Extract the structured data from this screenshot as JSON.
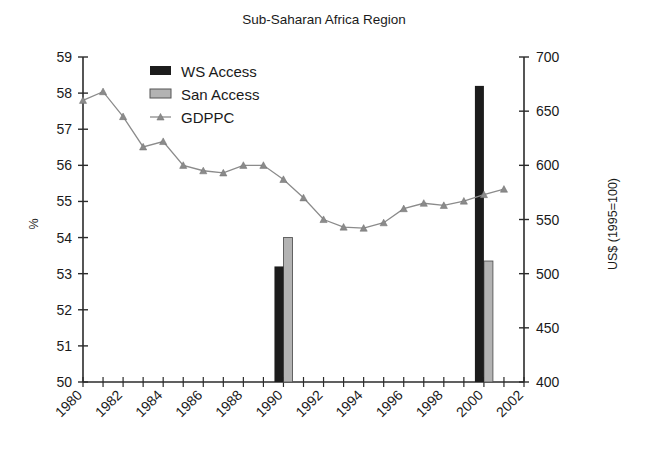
{
  "chart_data": {
    "type": "bar",
    "title": "Sub-Saharan Africa Region",
    "xlabel": "",
    "ylabel": "%",
    "ylabel_secondary": "US$ (1995=100)",
    "ylim": [
      50,
      59
    ],
    "ylim_secondary": [
      400,
      700
    ],
    "xlim": [
      1980,
      2002
    ],
    "grid": false,
    "legend_position": "top-left-inside",
    "x_tick_labels": [
      "1980",
      "1982",
      "1984",
      "1986",
      "1988",
      "1990",
      "1992",
      "1994",
      "1996",
      "1998",
      "2000",
      "2002"
    ],
    "x_tick_values": [
      1980,
      1982,
      1984,
      1986,
      1988,
      1990,
      1992,
      1994,
      1996,
      1998,
      2000,
      2002
    ],
    "y_tick_labels": [
      "50",
      "51",
      "52",
      "53",
      "54",
      "55",
      "56",
      "57",
      "58",
      "59"
    ],
    "y_tick_values": [
      50,
      51,
      52,
      53,
      54,
      55,
      56,
      57,
      58,
      59
    ],
    "y2_tick_labels": [
      "400",
      "450",
      "500",
      "550",
      "600",
      "650",
      "700"
    ],
    "y2_tick_values": [
      400,
      450,
      500,
      550,
      600,
      650,
      700
    ],
    "series": [
      {
        "name": "WS Access",
        "type": "bar",
        "axis": "left",
        "color": "#1c1c1c",
        "x": [
          1990,
          2000
        ],
        "values": [
          53.2,
          58.2
        ]
      },
      {
        "name": "San Access",
        "type": "bar",
        "axis": "left",
        "color": "#b3b3b3",
        "x": [
          1990,
          2000
        ],
        "values": [
          54.0,
          53.35
        ]
      },
      {
        "name": "GDPPC",
        "type": "line",
        "axis": "right",
        "color": "#8b8b8b",
        "x": [
          1980,
          1981,
          1982,
          1983,
          1984,
          1985,
          1986,
          1987,
          1988,
          1989,
          1990,
          1991,
          1992,
          1993,
          1994,
          1995,
          1996,
          1997,
          1998,
          1999,
          2000,
          2001
        ],
        "values_left_scale": [
          57.8,
          58.05,
          57.35,
          56.5,
          56.65,
          56.0,
          55.85,
          55.8,
          56.0,
          56.0,
          55.6,
          55.1,
          54.5,
          54.3,
          54.25,
          54.4,
          54.8,
          54.95,
          54.9,
          55.0,
          55.2,
          55.35
        ],
        "values": [
          660,
          668,
          645,
          617,
          622,
          600,
          595,
          593,
          600,
          600,
          587,
          570,
          550,
          543,
          542,
          547,
          560,
          565,
          563,
          567,
          573,
          578
        ]
      }
    ],
    "legend_entries": [
      {
        "label": "WS Access",
        "marker": "filled-square",
        "color": "#1c1c1c"
      },
      {
        "label": "San Access",
        "marker": "outlined-square",
        "color": "#b3b3b3"
      },
      {
        "label": "GDPPC",
        "marker": "line-triangle",
        "color": "#8b8b8b"
      }
    ]
  }
}
